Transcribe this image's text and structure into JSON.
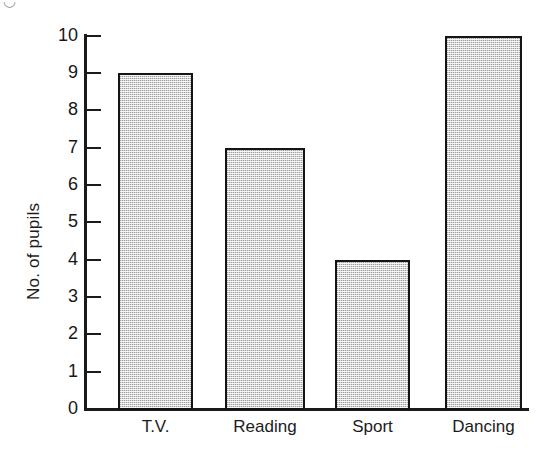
{
  "chart_data": {
    "type": "bar",
    "title": "",
    "xlabel": "",
    "ylabel": "No. of pupils",
    "categories": [
      "T.V.",
      "Reading",
      "Sport",
      "Dancing"
    ],
    "values": [
      9,
      7,
      4,
      10
    ],
    "ylim": [
      0,
      10
    ],
    "y_ticks": [
      "0",
      "1",
      "2",
      "3",
      "4",
      "5",
      "6",
      "7",
      "8",
      "9",
      "10"
    ],
    "grid": false,
    "legend": null,
    "bar_fill_color": "#d4d4d4",
    "bar_edge_color": "#141414",
    "axis_color": "#1a1a1a",
    "background_color": "#ffffff"
  },
  "axes": {
    "y_title": "No. of pupils"
  },
  "artifact": {
    "top_left_mark": "◡"
  }
}
